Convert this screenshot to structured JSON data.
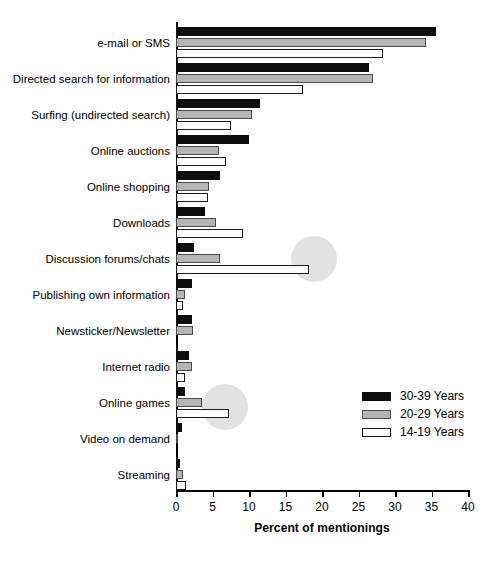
{
  "chart_data": {
    "type": "bar",
    "orientation": "horizontal",
    "title": "",
    "xlabel": "Percent of mentionings",
    "ylabel": "",
    "xlim": [
      0,
      40
    ],
    "xticks": [
      0,
      5,
      10,
      15,
      20,
      25,
      30,
      35,
      40
    ],
    "grid": false,
    "legend_position": "bottom-right",
    "categories": [
      "e-mail or SMS",
      "Directed search for information",
      "Surfing (undirected search)",
      "Online auctions",
      "Online shopping",
      "Downloads",
      "Discussion forums/chats",
      "Publishing own information",
      "Newsticker/Newsletter",
      "Internet radio",
      "Online games",
      "Video on demand",
      "Streaming"
    ],
    "series": [
      {
        "name": "30-39 Years",
        "color": "#0d0d0d",
        "values": [
          35.6,
          26.5,
          11.5,
          10.0,
          6.0,
          4.0,
          2.5,
          2.2,
          2.2,
          1.8,
          1.3,
          0.8,
          0.5
        ]
      },
      {
        "name": "20-29 Years",
        "color": "#b5b5b5",
        "values": [
          34.2,
          27.0,
          10.4,
          5.9,
          4.5,
          5.5,
          6.0,
          1.2,
          2.3,
          2.2,
          3.5,
          0.3,
          0.9
        ]
      },
      {
        "name": "14-19 Years",
        "color": "#ffffff",
        "values": [
          28.4,
          17.4,
          7.5,
          6.8,
          4.4,
          9.2,
          18.2,
          1.0,
          0.0,
          1.2,
          7.3,
          0.0,
          1.4
        ]
      }
    ],
    "annotations": [
      {
        "label": "highlight-discussion-forums-14-19",
        "category": "Discussion forums/chats",
        "series": "14-19 Years",
        "value": 18.2
      },
      {
        "label": "highlight-online-games-14-19",
        "category": "Online games",
        "series": "14-19 Years",
        "value": 7.3
      }
    ]
  },
  "legend": {
    "items": [
      {
        "label": "30-39 Years",
        "swatch": "black-solid"
      },
      {
        "label": "20-29 Years",
        "swatch": "gray-solid"
      },
      {
        "label": "14-19 Years",
        "swatch": "white-outline"
      }
    ]
  },
  "axis": {
    "x_title": "Percent of mentionings",
    "x_tick_labels": [
      "0",
      "5",
      "10",
      "15",
      "20",
      "25",
      "30",
      "35",
      "40"
    ]
  }
}
